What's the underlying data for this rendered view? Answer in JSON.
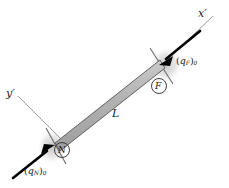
{
  "figure": {
    "background_color": "#ffffff",
    "beam_fill_color": "#b3b3b3",
    "beam_edge_color": "#4d4d4d",
    "arrow_color": "#000000",
    "axis_color": "#999999",
    "shadow_color": "#d9d9d9"
  },
  "axes": {
    "x_prime": {
      "label": "x",
      "prime": "′"
    },
    "y_prime": {
      "label": "y",
      "prime": "′"
    }
  },
  "beam": {
    "length_label": "L",
    "near_end": {
      "x": 58,
      "y": 148
    },
    "far_end": {
      "x": 160,
      "y": 67
    }
  },
  "nodes": [
    {
      "id": "near",
      "letter": "N",
      "name": "near-node"
    },
    {
      "id": "far",
      "letter": "F",
      "name": "far-node"
    }
  ],
  "loads": [
    {
      "id": "near",
      "symbol": "q",
      "subscript": "N",
      "magnitude_subscript": "0",
      "open_paren": "(",
      "close_paren": ")",
      "direction": "up-right"
    },
    {
      "id": "far",
      "symbol": "q",
      "subscript": "F",
      "magnitude_subscript": "0",
      "open_paren": "(",
      "close_paren": ")",
      "direction": "down-left"
    }
  ]
}
